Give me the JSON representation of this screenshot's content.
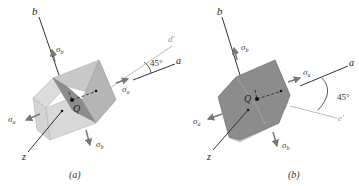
{
  "figures": [
    {
      "id": "a",
      "caption": "(a)",
      "axis_labels": {
        "b": "b",
        "z": "z",
        "a": "a",
        "d": "d'"
      },
      "origin_label": "Q",
      "angle_label": "45°",
      "stress_labels": {
        "sigma_a": "σ",
        "sigma_a_sub": "a",
        "sigma_b": "σ",
        "sigma_b_sub": "b"
      }
    },
    {
      "id": "b",
      "caption": "(b)",
      "axis_labels": {
        "b": "b",
        "z": "z",
        "a": "a",
        "e": "e'"
      },
      "origin_label": "Q",
      "angle_label": "45°",
      "stress_labels": {
        "sigma_a": "σ",
        "sigma_a_sub": "a",
        "sigma_b": "σ",
        "sigma_b_sub": "b"
      }
    }
  ],
  "colors": {
    "face_light": "#dcdcdc",
    "face_mid": "#b9b9b9",
    "face_dark": "#8c8c8c",
    "axis": "#333333",
    "arrow": "#777777",
    "guide": "#bbbbbb"
  }
}
